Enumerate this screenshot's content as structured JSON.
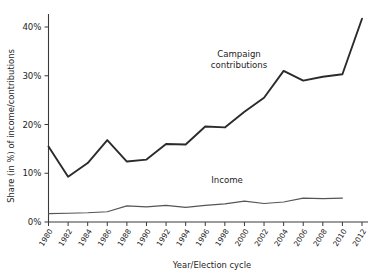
{
  "chart_data": {
    "type": "line",
    "title": "",
    "xlabel": "Year/Election cycle",
    "ylabel": "Share (in %) of income/contributions",
    "categories": [
      "1980",
      "1982",
      "1984",
      "1986",
      "1988",
      "1990",
      "1992",
      "1994",
      "1996",
      "1998",
      "2000",
      "2002",
      "2004",
      "2006",
      "2008",
      "2010",
      "2012"
    ],
    "ytick_labels": [
      "0%",
      "10%",
      "20%",
      "30%",
      "40%"
    ],
    "ytick_values": [
      0,
      10,
      20,
      30,
      40
    ],
    "ylim": [
      0,
      44
    ],
    "grid": false,
    "legend_position": "inline-annotation",
    "series": [
      {
        "name": "Campaign contributions",
        "color": "#2b2b2b",
        "width": 1.9,
        "values": [
          15.5,
          9.3,
          12.1,
          16.8,
          12.4,
          12.8,
          16.0,
          15.9,
          19.6,
          19.4,
          22.6,
          25.5,
          31.0,
          29.0,
          29.8,
          30.3,
          41.7
        ]
      },
      {
        "name": "Income",
        "color": "#555555",
        "width": 1.2,
        "values": [
          1.7,
          1.8,
          1.9,
          2.1,
          3.3,
          3.1,
          3.4,
          3.0,
          3.4,
          3.7,
          4.3,
          3.8,
          4.1,
          4.9,
          4.8,
          4.9,
          null
        ]
      }
    ],
    "annotations": [
      {
        "name": "campaign-contributions",
        "line1": "Campaign",
        "line2": "contributions"
      },
      {
        "name": "income",
        "line1": "Income",
        "line2": ""
      }
    ]
  }
}
